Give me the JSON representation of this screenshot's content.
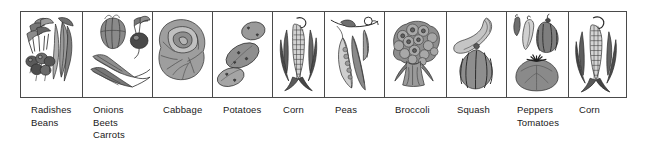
{
  "figure": {
    "kind": "vegetable-illustration-strip",
    "panel_count": 10,
    "colors": {
      "background": "#ffffff",
      "border": "#4a4a4a",
      "ink": "#1a1a1a",
      "shade_light": "#b9b9b9",
      "shade_mid": "#8e8e8e",
      "shade_dark": "#4f4f4f"
    }
  },
  "panels": [
    {
      "id": "panel-radishes-beans",
      "illustration": "radishes-and-bean-pods",
      "labels": [
        "Radishes",
        "Beans"
      ]
    },
    {
      "id": "panel-onions-beets-carrots",
      "illustration": "onion-beet-and-carrots",
      "labels": [
        "Onions",
        "Beets",
        "Carrots"
      ]
    },
    {
      "id": "panel-cabbage",
      "illustration": "cabbage-head",
      "labels": [
        "Cabbage"
      ]
    },
    {
      "id": "panel-potatoes",
      "illustration": "three-potatoes",
      "labels": [
        "Potatoes"
      ]
    },
    {
      "id": "panel-corn-left",
      "illustration": "corn-ear-with-husk",
      "labels": [
        "Corn"
      ]
    },
    {
      "id": "panel-peas",
      "illustration": "pea-pods-on-vine",
      "labels": [
        "Peas"
      ]
    },
    {
      "id": "panel-broccoli",
      "illustration": "broccoli-crown",
      "labels": [
        "Broccoli"
      ]
    },
    {
      "id": "panel-squash",
      "illustration": "crookneck-and-acorn-squash",
      "labels": [
        "Squash"
      ]
    },
    {
      "id": "panel-peppers-tomatoes",
      "illustration": "peppers-and-tomato",
      "labels": [
        "Peppers",
        "Tomatoes"
      ]
    },
    {
      "id": "panel-corn-right",
      "illustration": "corn-ear-with-husk",
      "labels": [
        "Corn"
      ]
    }
  ]
}
